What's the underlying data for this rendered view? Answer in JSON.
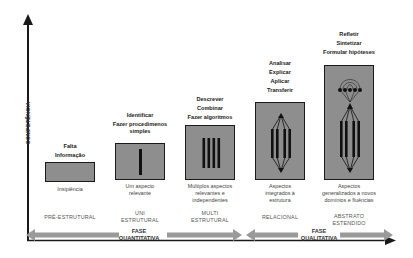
{
  "axis": {
    "y_label": "COMPETÊNCIA"
  },
  "levels": [
    {
      "name": "PRÉ-ESTRUTURAL",
      "top_text": [
        "Falta",
        "Informação"
      ],
      "bottom_text": [
        "Insipiência"
      ],
      "icon": "empty-box"
    },
    {
      "name": "UNI ESTRUTURAL",
      "name_lines": [
        "UNI",
        "ESTRUTURAL"
      ],
      "top_text": [
        "Identificar",
        "Fazer procedimenos",
        "simples"
      ],
      "bottom_text": [
        "Um aspecto",
        "relevante"
      ],
      "icon": "single-bar"
    },
    {
      "name": "MULTI ESTRUTURAL",
      "name_lines": [
        "MULTI",
        "ESTRUTURAL"
      ],
      "top_text": [
        "Descrever",
        "Combinar",
        "Fazer algoritmos"
      ],
      "bottom_text": [
        "Múltiplos aspectos",
        "relevantes e",
        "independentes"
      ],
      "icon": "four-bars"
    },
    {
      "name": "RELACIONAL",
      "top_text": [
        "Analisar",
        "Explicar",
        "Aplicar",
        "Transferir"
      ],
      "bottom_text": [
        "Aspectos",
        "integrados à",
        "estrutura"
      ],
      "icon": "integrated-bars"
    },
    {
      "name": "ABSTRATO ESTENDIDO",
      "name_lines": [
        "ABSTRATO",
        "ESTENDIDO"
      ],
      "top_text": [
        "Refletir",
        "Sintetizar",
        "Formular hipóteses"
      ],
      "bottom_text": [
        "Aspectos",
        "generalizados a novos",
        "domínios e fluências"
      ],
      "icon": "extended-structure"
    }
  ],
  "phases": [
    {
      "lines": [
        "FASE",
        "QUANTITATIVA"
      ]
    },
    {
      "lines": [
        "FASE",
        "QUALITATIVA"
      ]
    }
  ],
  "colors": {
    "box_fill": "#8e8e8e",
    "bar": "#111111",
    "arrow_gray": "#9a9a9a",
    "axis": "#1a1a1a"
  }
}
